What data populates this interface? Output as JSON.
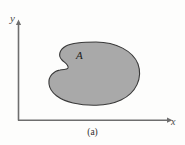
{
  "figure": {
    "caption": "(a)",
    "region_label": "A",
    "axes": {
      "x_label": "x",
      "y_label": "y",
      "x_axis_name": "horizontal-axis",
      "y_axis_name": "vertical-axis",
      "origin_x": 18,
      "origin_y": 120,
      "x_axis_end": 172,
      "y_axis_top": 22,
      "arrowhead_x_icon": "arrow-right-icon",
      "arrowhead_y_icon": "arrow-up-icon"
    },
    "region": {
      "name": "shaded-planar-region",
      "description": "kidney-shaped shaded planar region with concave notch on left side",
      "fill_color": "#a9a9a9",
      "stroke_color": "#3a3a3a",
      "stroke_width": 1,
      "bounds": {
        "left": 50,
        "top": 42,
        "right": 140,
        "bottom": 105
      },
      "path": "M 96 42 C 116 42 133 51 138 64 C 143 78 136 93 121 100 C 106 107 86 106 73 103 C 60 100 50 93 49 84 C 48 76 54 71 60 70 C 64 69 67 70 68 68 C 69 65 65 63 62 60 C 58 56 59 50 66 46 C 74 42 86 42 96 42 Z"
    },
    "colors": {
      "background": "#fdfdfc",
      "axis_stroke": "#6e6e6e",
      "region_fill": "#a9a9a9",
      "region_stroke": "#3a3a3a",
      "label_text": "#4a4a4a",
      "caption_text": "#2e2e2e"
    }
  },
  "chart_data": {
    "type": "diagram",
    "title": "",
    "subtitle": "",
    "xlabel": "x",
    "ylabel": "y",
    "caption": "(a)",
    "annotations": [
      "A"
    ],
    "grid": false,
    "legend": "none",
    "shapes": [
      {
        "kind": "closed-region",
        "label": "A",
        "fill": "#a9a9a9",
        "stroke": "#3a3a3a",
        "approx_bbox": [
          50,
          42,
          140,
          105
        ]
      }
    ]
  }
}
